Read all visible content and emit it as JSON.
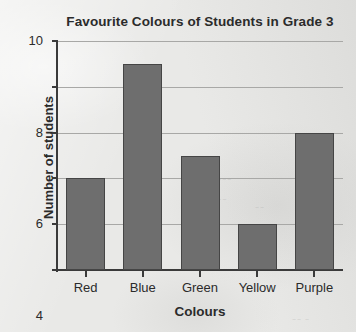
{
  "chart_data": {
    "type": "bar",
    "title": "Favourite Colours of Students in Grade 3",
    "xlabel": "Colours",
    "ylabel": "Number of students",
    "categories": [
      "Red",
      "Blue",
      "Green",
      "Yellow",
      "Purple"
    ],
    "values": [
      4,
      9,
      5,
      2,
      6
    ],
    "ylim": [
      0,
      10
    ],
    "ytick_labels": [
      "0",
      "2",
      "4",
      "6",
      "8",
      "10"
    ],
    "ytick_values": [
      0,
      2,
      4,
      6,
      8,
      10
    ],
    "grid": true,
    "legend": false,
    "bar_color": "#6e6e6e",
    "bar_border_color": "#454545",
    "axis_color": "#3a3a3a",
    "gridline_color": "#a8a8a6",
    "background_color": "#e9e9e7",
    "text_color": "#2b2b2b"
  }
}
